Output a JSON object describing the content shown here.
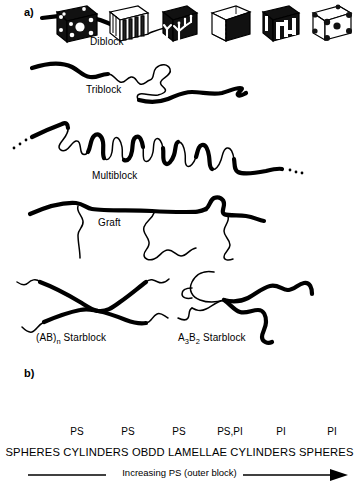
{
  "figure": {
    "panel_a": {
      "label": "a)",
      "architectures": [
        {
          "name": "diblock",
          "label": "Diblock"
        },
        {
          "name": "triblock",
          "label": "Triblock"
        },
        {
          "name": "multiblock",
          "label": "Multiblock"
        },
        {
          "name": "graft",
          "label": "Graft"
        },
        {
          "name": "abn-starblock",
          "label": "(AB)",
          "sub": "n",
          "suffix": " Starblock"
        },
        {
          "name": "a3b2-starblock",
          "label": "A",
          "sub": "3",
          "label2": "B",
          "sub2": "2",
          "suffix": " Starblock"
        }
      ]
    },
    "panel_b": {
      "label": "b)",
      "cubes": [
        {
          "name": "spheres-ps",
          "morphology": "SPHERES",
          "component": "PS"
        },
        {
          "name": "cylinders-ps",
          "morphology": "CYLINDERS",
          "component": "PS"
        },
        {
          "name": "obdd-ps",
          "morphology": "OBDD",
          "component": "PS"
        },
        {
          "name": "lamellae",
          "morphology": "LAMELLAE",
          "component": "PS,PI"
        },
        {
          "name": "cylinders-pi",
          "morphology": "CYLINDERS",
          "component": "PI"
        },
        {
          "name": "spheres-pi",
          "morphology": "SPHERES",
          "component": "PI"
        }
      ],
      "morphology_row": "SPHERES CYLINDERS OBDD LAMELLAE CYLINDERS SPHERES",
      "gradient_caption": "Increasing PS (outer block)"
    },
    "colors": {
      "ink": "#000000",
      "background": "#ffffff"
    }
  }
}
